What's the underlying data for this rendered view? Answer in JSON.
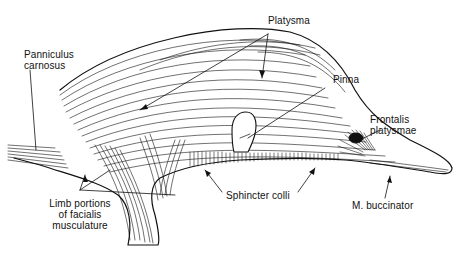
{
  "figure": {
    "labels": {
      "panniculus": [
        "Panniculus",
        "carnosus"
      ],
      "platysma": "Platysma",
      "pinna": "Pinna",
      "frontalis": [
        "Frontalis",
        "platysmae"
      ],
      "limb": [
        "Limb portions",
        "of facialis",
        "musculature"
      ],
      "sphincter": "Sphincter colli",
      "buccinator": "M. buccinator"
    },
    "colors": {
      "ink": "#111111",
      "background": "#ffffff"
    }
  }
}
